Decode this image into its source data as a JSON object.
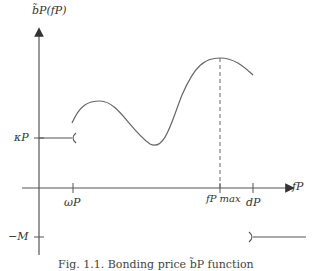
{
  "figure": {
    "y_axis_label": "b̃P(fP)",
    "x_axis_label": "fP",
    "y_ticks": [
      {
        "label": "κP",
        "y": 138
      },
      {
        "label": "−M",
        "y": 237
      }
    ],
    "x_ticks": [
      {
        "label": "ωP",
        "x": 73
      },
      {
        "label": "fP max",
        "x": 220
      },
      {
        "label": "dP",
        "x": 253
      }
    ],
    "caption": "Fig. 1.1. Bonding price b̃P function",
    "line_color": "#555555"
  }
}
